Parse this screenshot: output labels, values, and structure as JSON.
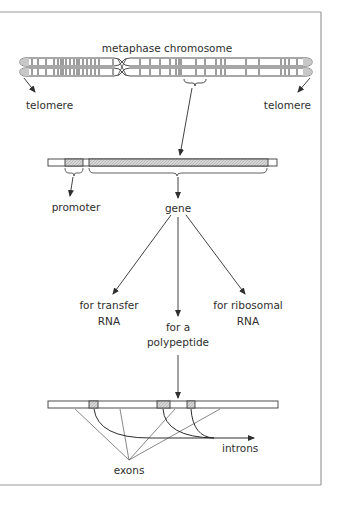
{
  "diagram": {
    "title": "metaphase chromosome",
    "labels": {
      "telomere_left": "telomere",
      "telomere_right": "telomere",
      "promoter": "promoter",
      "gene": "gene",
      "transfer_rna_line1": "for transfer",
      "transfer_rna_line2": "RNA",
      "polypeptide_line1": "for a",
      "polypeptide_line2": "polypeptide",
      "ribosomal_rna_line1": "for ribosomal",
      "ribosomal_rna_line2": "RNA",
      "introns": "introns",
      "exons": "exons"
    },
    "colors": {
      "line": "#3a3a3a",
      "frame": "#9a9a9a",
      "shaded": "#cfcfcf",
      "telomere_cap": "#c8c8c8"
    }
  }
}
